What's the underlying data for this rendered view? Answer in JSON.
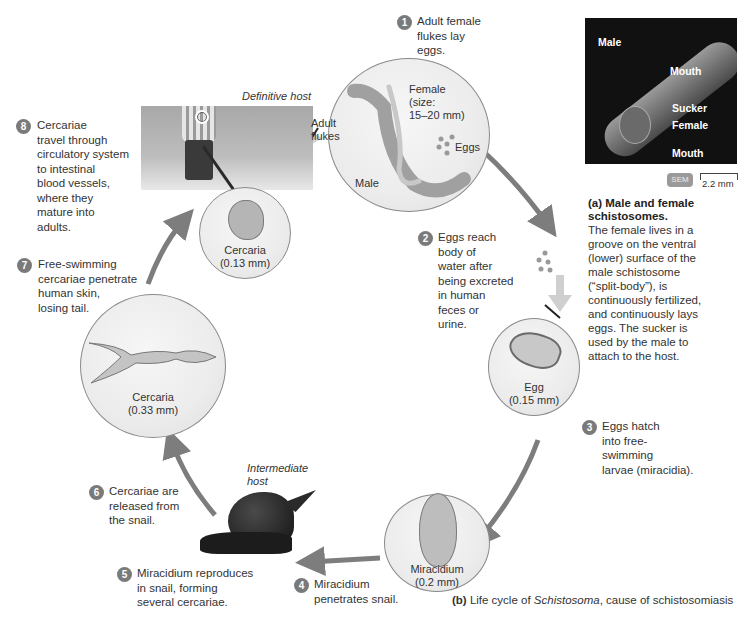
{
  "figure": {
    "caption_b_prefix": "(b)",
    "caption_b_text_1": " Life cycle of ",
    "caption_b_italic": "Schistosoma",
    "caption_b_text_2": ", cause of schistosomiasis"
  },
  "hosts": {
    "definitive": "Definitive host",
    "intermediate": "Intermediate\nhost"
  },
  "steps": [
    {
      "num": "1",
      "text": "Adult female\nflukes lay\neggs."
    },
    {
      "num": "2",
      "text": "Eggs reach\nbody of\nwater after\nbeing excreted\nin human\nfeces or\nurine."
    },
    {
      "num": "3",
      "text": "Eggs hatch\ninto free-\nswimming\nlarvae (miracidia)."
    },
    {
      "num": "4",
      "text": "Miracidium\npenetrates snail."
    },
    {
      "num": "5",
      "text": "Miracidium reproduces\nin snail, forming\nseveral cercariae."
    },
    {
      "num": "6",
      "text": "Cercariae are\nreleased from\nthe snail."
    },
    {
      "num": "7",
      "text": "Free-swimming\ncercariae penetrate\nhuman skin,\nlosing tail."
    },
    {
      "num": "8",
      "text": "Cercariae\ntravel through\ncirculatory system\nto intestinal\nblood vessels,\nwhere they\nmature into\nadults."
    }
  ],
  "stages": {
    "adult": {
      "adult_flukes": "Adult\nflukes",
      "female": "Female\n(size:\n15–20 mm)",
      "male": "Male",
      "eggs": "Eggs"
    },
    "egg": "Egg\n(0.15 mm)",
    "miracidium": "Miracidium\n(0.2 mm)",
    "cercaria_large": "Cercaria\n(0.33 mm)",
    "cercaria_small": "Cercaria\n(0.13 mm)"
  },
  "sem_panel": {
    "labels": {
      "male": "Male",
      "mouth_top": "Mouth",
      "sucker": "Sucker",
      "female": "Female",
      "mouth_bottom": "Mouth"
    },
    "badge": "SEM",
    "scale": "2.2 mm",
    "caption_title": "(a) Male and female\nschistosomes.",
    "caption_body": "The female lives in a\ngroove on the ventral\n(lower) surface of the\nmale schistosome\n(“split-body”), is\ncontinuously fertilized,\nand continuously lays\neggs. The sucker is\nused by the male to\nattach to the host."
  },
  "colors": {
    "badge": "#7a7a7a",
    "arrow": "#7d7d7d",
    "text": "#333333",
    "sem_bg": "#111111"
  }
}
